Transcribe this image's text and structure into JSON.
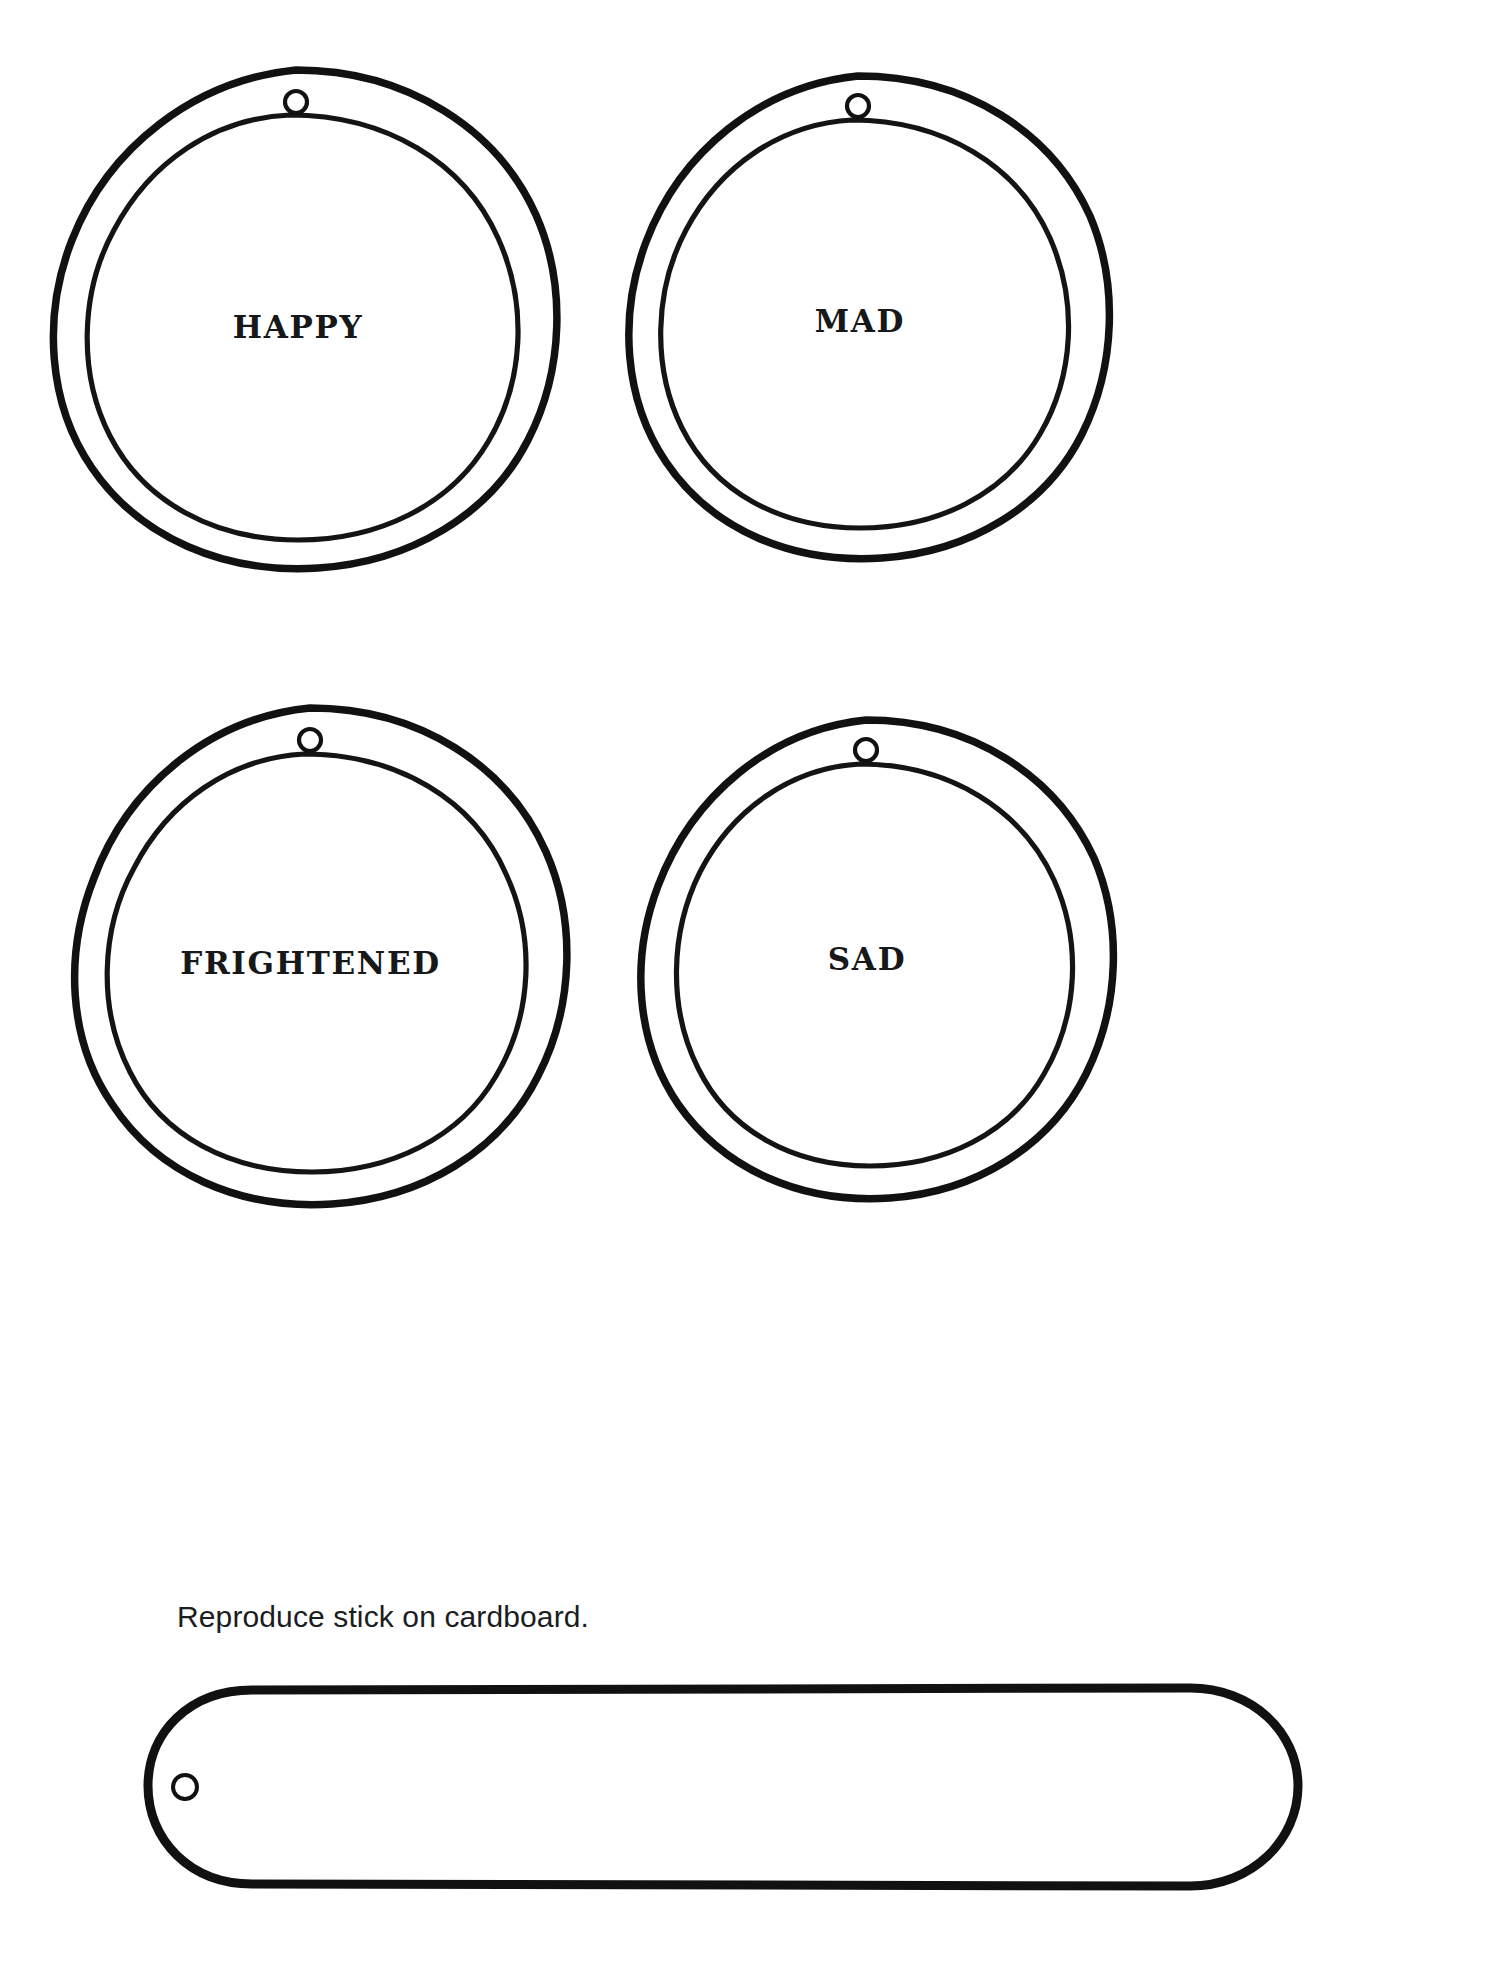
{
  "page": {
    "background_color": "#ffffff",
    "ink_color": "#111111"
  },
  "tags": [
    {
      "id": "happy",
      "label": "HAPPY",
      "hole_icon": "punch-hole-icon",
      "position": "top-left"
    },
    {
      "id": "mad",
      "label": "MAD",
      "hole_icon": "punch-hole-icon",
      "position": "top-right"
    },
    {
      "id": "frightened",
      "label": "FRIGHTENED",
      "hole_icon": "punch-hole-icon",
      "position": "bottom-left"
    },
    {
      "id": "sad",
      "label": "SAD",
      "hole_icon": "punch-hole-icon",
      "position": "bottom-right"
    }
  ],
  "caption": {
    "text": "Reproduce stick on cardboard."
  },
  "stick": {
    "shape": "rounded-pill",
    "hole_icon": "punch-hole-icon"
  }
}
